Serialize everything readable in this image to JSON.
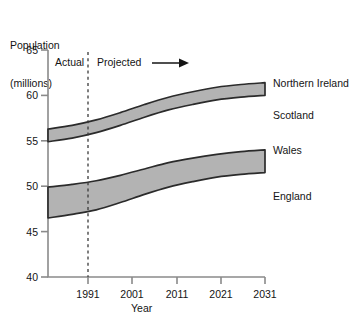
{
  "chart_data": {
    "type": "area",
    "title": "",
    "ylabel_line1": "Population",
    "ylabel_line2": "(millions)",
    "xlabel": "Year",
    "ylim": [
      40,
      65
    ],
    "xlim": [
      1986,
      2031
    ],
    "yticks": [
      65,
      60,
      55,
      50,
      45,
      40
    ],
    "xticks": [
      1991,
      2001,
      2011,
      2021,
      2031
    ],
    "grid": false,
    "legend_position": "right-inline",
    "annotations": [
      {
        "text": "Actual",
        "x": 1988.5,
        "y": 63.2
      },
      {
        "text": "Projected",
        "x": 1995.5,
        "y": 63.2
      }
    ],
    "divider": {
      "x": 1991,
      "style": "dashed",
      "label_left": "Actual",
      "label_right": "Projected"
    },
    "x": [
      1986,
      1991,
      1996,
      2001,
      2006,
      2011,
      2016,
      2021,
      2026,
      2031
    ],
    "series": [
      {
        "name": "England",
        "role": "lower-boundary-of-lower-band",
        "values": [
          46.5,
          46.9,
          47.4,
          48.2,
          49.1,
          49.9,
          50.5,
          51.0,
          51.3,
          51.5
        ]
      },
      {
        "name": "Wales",
        "role": "upper-boundary-of-lower-band",
        "values": [
          49.9,
          50.2,
          50.6,
          51.2,
          51.9,
          52.6,
          53.1,
          53.5,
          53.8,
          54.0
        ]
      },
      {
        "name": "Scotland",
        "role": "lower-boundary-of-upper-band",
        "values": [
          54.9,
          55.3,
          55.9,
          56.7,
          57.6,
          58.4,
          59.0,
          59.5,
          59.8,
          60.0
        ]
      },
      {
        "name": "Northern Ireland",
        "role": "upper-boundary-of-upper-band",
        "values": [
          56.3,
          56.7,
          57.3,
          58.1,
          59.0,
          59.8,
          60.4,
          60.9,
          61.2,
          61.4
        ]
      }
    ],
    "bands": [
      {
        "name": "upper-band",
        "between": [
          "Scotland",
          "Northern Ireland"
        ],
        "fill": "#b3b3b3"
      },
      {
        "name": "lower-band",
        "between": [
          "England",
          "Wales"
        ],
        "fill": "#b3b3b3"
      }
    ],
    "region_labels": [
      {
        "text": "Northern Ireland",
        "y_value": 61.2
      },
      {
        "text": "Scotland",
        "y_value": 58.2
      },
      {
        "text": "Wales",
        "y_value": 53.8
      },
      {
        "text": "England",
        "y_value": 49.0
      }
    ],
    "colors": {
      "band_fill": "#b3b3b3",
      "band_stroke": "#2b2b2b",
      "axis": "#808080",
      "text": "#141414"
    }
  }
}
